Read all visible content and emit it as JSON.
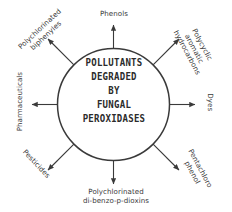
{
  "diagram": {
    "type": "radial-hub-and-spoke",
    "background_color": "#ffffff",
    "stroke_color": "#3a3a3a",
    "text_color": "#3a3a3a",
    "center": {
      "shape": "circle",
      "lines": [
        "POLLUTANTS",
        "DEGRADED",
        "BY",
        "FUNGAL",
        "PEROXIDASES"
      ]
    },
    "nodes": [
      {
        "id": "phenols",
        "position": "top",
        "angle_deg": 90,
        "arrow_direction": "up",
        "rotation_deg": 0,
        "lines": [
          "Phenols"
        ]
      },
      {
        "id": "polychlorinated-biphenyles",
        "position": "top-left",
        "angle_deg": 135,
        "arrow_direction": "up-left",
        "rotation_deg": -43,
        "lines": [
          "Polychlorinated",
          "biphenyles"
        ]
      },
      {
        "id": "polycyclic-aromatic-hydrocarbons",
        "position": "top-right",
        "angle_deg": 45,
        "arrow_direction": "up-right",
        "rotation_deg": 62,
        "lines": [
          "Polycyclic",
          "aromatic",
          "hydrocarbons"
        ]
      },
      {
        "id": "pharmaceuticals",
        "position": "left",
        "angle_deg": 180,
        "arrow_direction": "left",
        "rotation_deg": -90,
        "lines": [
          "Pharmaceuticals"
        ]
      },
      {
        "id": "dyes",
        "position": "right",
        "angle_deg": 0,
        "arrow_direction": "right",
        "rotation_deg": 90,
        "lines": [
          "Dyes"
        ]
      },
      {
        "id": "pesticides",
        "position": "bottom-left",
        "angle_deg": 225,
        "arrow_direction": "down-left",
        "rotation_deg": 47,
        "lines": [
          "Pesticides"
        ]
      },
      {
        "id": "pentachloro-phenol",
        "position": "bottom-right",
        "angle_deg": 315,
        "arrow_direction": "down-right",
        "rotation_deg": 62,
        "lines": [
          "Pentachloro",
          "phenol"
        ]
      },
      {
        "id": "polychlorinated-di-benzo-p-dioxins",
        "position": "bottom",
        "angle_deg": 270,
        "arrow_direction": "down",
        "rotation_deg": 0,
        "lines": [
          "Polychlorinated",
          "di-benzo-p-dioxins"
        ]
      }
    ]
  }
}
